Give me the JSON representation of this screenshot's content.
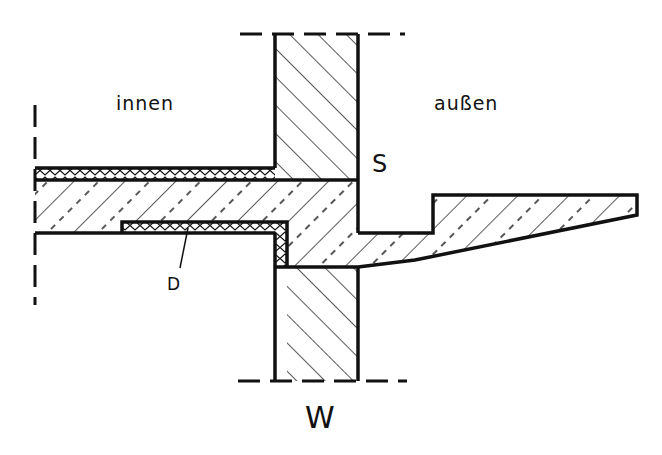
{
  "figure": {
    "type": "construction detail section",
    "colors": {
      "line": "#111111",
      "background": "#ffffff"
    }
  },
  "labels": {
    "inside": "innen",
    "outside": "außen",
    "s": "S",
    "d": "D",
    "w": "W"
  },
  "legend": {
    "S": "slab / floor",
    "D": "insulation layer",
    "W": "wall"
  }
}
